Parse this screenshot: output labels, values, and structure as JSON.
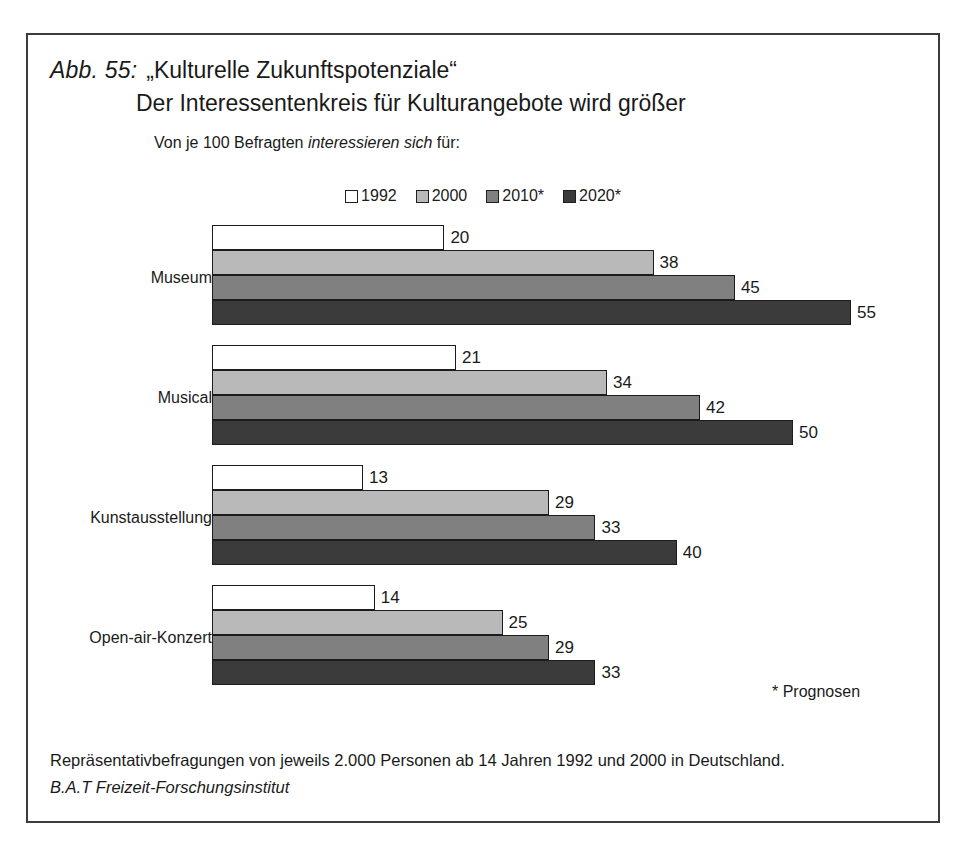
{
  "figure": {
    "number_label": "Abb. 55:",
    "title_line_1": "„Kulturelle Zukunftspotenziale“",
    "title_line_2": "Der Interessentenkreis für Kulturangebote wird größer",
    "subtitle_prefix": "Von je 100 Befragten ",
    "subtitle_emphasis": "interessieren sich",
    "subtitle_suffix": " für:",
    "prognosen_note": "* Prognosen",
    "footer_line_1": "Repräsentativbefragungen von jeweils 2.000 Personen ab 14 Jahren 1992 und 2000 in Deutschland.",
    "footer_line_2": "B.A.T Freizeit-Forschungsinstitut"
  },
  "legend": {
    "items": [
      {
        "label": "1992",
        "color": "#ffffff"
      },
      {
        "label": "2000",
        "color": "#b9b9b9"
      },
      {
        "label": "2010*",
        "color": "#808080"
      },
      {
        "label": "2020*",
        "color": "#3b3b3b"
      }
    ]
  },
  "chart_data": {
    "type": "bar",
    "orientation": "horizontal",
    "subtitle": "Von je 100 Befragten interessieren sich für:",
    "xlabel": "",
    "ylabel": "",
    "xlim": [
      0,
      55
    ],
    "grid": false,
    "legend_position": "top-center",
    "unit": "von je 100 Befragten",
    "categories": [
      "Museum",
      "Musical",
      "Kunstausstellung",
      "Open-air-Konzert"
    ],
    "series": [
      {
        "name": "1992",
        "color": "#ffffff",
        "values": [
          20,
          21,
          13,
          14
        ]
      },
      {
        "name": "2000",
        "color": "#b9b9b9",
        "values": [
          38,
          34,
          29,
          25
        ]
      },
      {
        "name": "2010*",
        "color": "#808080",
        "values": [
          45,
          42,
          33,
          29
        ]
      },
      {
        "name": "2020*",
        "color": "#3b3b3b",
        "values": [
          55,
          50,
          40,
          33
        ]
      }
    ],
    "annotations": [
      "* Prognosen"
    ],
    "source": "B.A.T Freizeit-Forschungsinstitut"
  },
  "render": {
    "px_per_unit": 11.62
  }
}
